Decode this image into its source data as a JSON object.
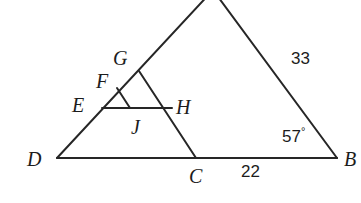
{
  "figure": {
    "type": "geometry-diagram",
    "background_color": "#ffffff",
    "stroke_color": "#262626",
    "stroke_width": 2,
    "canvas": {
      "width": 361,
      "height": 203
    }
  },
  "points": {
    "A": {
      "label": "A",
      "x": 213,
      "y": -8,
      "visible": false,
      "on_canvas": false
    },
    "B": {
      "label": "B",
      "x": 337,
      "y": 158,
      "visible": true
    },
    "C": {
      "label": "C",
      "x": 196,
      "y": 158,
      "visible": true
    },
    "D": {
      "label": "D",
      "x": 57,
      "y": 158,
      "visible": true
    },
    "E": {
      "label": "E",
      "x": 102,
      "y": 108,
      "visible": true
    },
    "F": {
      "label": "F",
      "x": 117,
      "y": 88,
      "visible": true
    },
    "G": {
      "label": "G",
      "x": 139,
      "y": 71,
      "visible": true
    },
    "H": {
      "label": "H",
      "x": 172,
      "y": 108,
      "visible": true
    },
    "J": {
      "label": "J",
      "x": 130,
      "y": 108,
      "visible": true
    }
  },
  "point_labels": [
    {
      "name": "label-G",
      "text": "G",
      "x": 113,
      "y": 48
    },
    {
      "name": "label-F",
      "text": "F",
      "x": 96,
      "y": 71
    },
    {
      "name": "label-E",
      "text": "E",
      "x": 72,
      "y": 95
    },
    {
      "name": "label-H",
      "text": "H",
      "x": 176,
      "y": 97
    },
    {
      "name": "label-J",
      "text": "J",
      "x": 131,
      "y": 117
    },
    {
      "name": "label-D",
      "text": "D",
      "x": 27,
      "y": 149
    },
    {
      "name": "label-C",
      "text": "C",
      "x": 189,
      "y": 166
    },
    {
      "name": "label-B",
      "text": "B",
      "x": 344,
      "y": 149
    }
  ],
  "segments": [
    {
      "name": "side-DB",
      "from": "D",
      "to": "B"
    },
    {
      "name": "side-DA",
      "from": "D",
      "to": "A"
    },
    {
      "name": "side-AB",
      "from": "A",
      "to": "B"
    },
    {
      "name": "segment-GC",
      "from": "G",
      "to": "C"
    },
    {
      "name": "segment-EH",
      "from": "E",
      "to": "H"
    },
    {
      "name": "segment-FJ",
      "from": "F",
      "to": "J"
    }
  ],
  "measurements": [
    {
      "name": "length-AB",
      "text": "33",
      "x": 291,
      "y": 50,
      "kind": "length"
    },
    {
      "name": "length-CB",
      "text": "22",
      "x": 241,
      "y": 163,
      "kind": "length"
    },
    {
      "name": "angle-B",
      "text": "57",
      "symbol": "°",
      "x": 282,
      "y": 126,
      "kind": "angle"
    }
  ],
  "given": {
    "side_AB": "33",
    "side_CB": "22",
    "angle_B": "57°"
  }
}
